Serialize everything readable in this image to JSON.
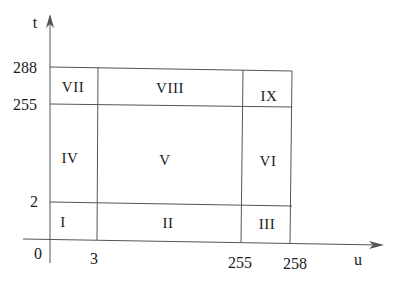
{
  "diagram": {
    "axes": {
      "t": {
        "label": "t",
        "ticks": [
          "0",
          "2",
          "255",
          "288"
        ]
      },
      "u": {
        "label": "u",
        "ticks": [
          "3",
          "255",
          "258"
        ]
      }
    },
    "regions": [
      "I",
      "II",
      "III",
      "IV",
      "V",
      "VI",
      "VII",
      "VIII",
      "IX"
    ],
    "colors": {
      "line": "#555555",
      "text": "#1a1a1a",
      "background": "#ffffff"
    }
  }
}
